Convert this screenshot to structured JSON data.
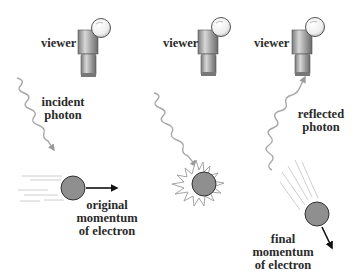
{
  "diagram": {
    "type": "heisenberg-microscope-photon-electron-scattering",
    "panels": [
      {
        "id": "before",
        "viewer_label": "viewer",
        "photon_label_line1": "incident",
        "photon_label_line2": "photon",
        "momentum_label_line1": "original",
        "momentum_label_line2": "momentum",
        "momentum_label_line3": "of electron"
      },
      {
        "id": "collision",
        "viewer_label": "viewer"
      },
      {
        "id": "after",
        "viewer_label": "viewer",
        "photon_label_line1": "reflected",
        "photon_label_line2": "photon",
        "momentum_label_line1": "final",
        "momentum_label_line2": "momentum",
        "momentum_label_line3": "of electron"
      }
    ],
    "colors": {
      "electron_fill": "#8f8f8f",
      "electron_stroke": "#333333",
      "photon_wave": "#a8a8a8",
      "arrow": "#111111",
      "viewer_body": "#9a9a9a",
      "text": "#2a2a2a"
    }
  }
}
